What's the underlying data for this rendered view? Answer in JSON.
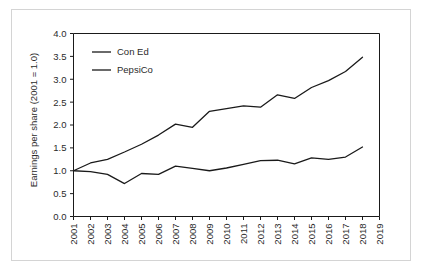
{
  "figure": {
    "background_color": "#ffffff",
    "border_color": "#d4d4d4",
    "line_color": "#1a1a1a",
    "text_color": "#2b2b2b"
  },
  "chart_data": {
    "type": "line",
    "title": "",
    "subtitle": "",
    "xlabel": "",
    "ylabel": "Earnings per share (2001 = 1.0)",
    "xlim": [
      2001,
      2019
    ],
    "ylim": [
      0.0,
      4.0
    ],
    "grid": false,
    "legend_position": "upper left",
    "x": [
      2001,
      2002,
      2003,
      2004,
      2005,
      2006,
      2007,
      2008,
      2009,
      2010,
      2011,
      2012,
      2013,
      2014,
      2015,
      2016,
      2017,
      2018
    ],
    "xtick_labels": [
      "2001",
      "2002",
      "2003",
      "2004",
      "2005",
      "2006",
      "2007",
      "2008",
      "2009",
      "2010",
      "2011",
      "2012",
      "2013",
      "2014",
      "2015",
      "2016",
      "2017",
      "2018",
      "2019"
    ],
    "xticks": [
      2001,
      2002,
      2003,
      2004,
      2005,
      2006,
      2007,
      2008,
      2009,
      2010,
      2011,
      2012,
      2013,
      2014,
      2015,
      2016,
      2017,
      2018,
      2019
    ],
    "ytick_labels": [
      "0.0",
      "0.5",
      "1.0",
      "1.5",
      "2.0",
      "2.5",
      "3.0",
      "3.5",
      "4.0"
    ],
    "yticks": [
      0.0,
      0.5,
      1.0,
      1.5,
      2.0,
      2.5,
      3.0,
      3.5,
      4.0
    ],
    "series": [
      {
        "name": "Con Ed",
        "color": "#1a1a1a",
        "values": [
          1.0,
          1.17,
          1.25,
          1.41,
          1.58,
          1.78,
          2.02,
          1.95,
          2.3,
          2.36,
          2.42,
          2.39,
          2.66,
          2.58,
          2.82,
          2.97,
          3.17,
          3.48
        ]
      },
      {
        "name": "PepsiCo",
        "color": "#1a1a1a",
        "values": [
          1.0,
          0.98,
          0.92,
          0.72,
          0.94,
          0.92,
          1.1,
          1.05,
          1.0,
          1.06,
          1.14,
          1.22,
          1.23,
          1.15,
          1.28,
          1.25,
          1.3,
          1.52
        ]
      }
    ]
  },
  "legend": {
    "entries": [
      {
        "label": "Con Ed"
      },
      {
        "label": "PepsiCo"
      }
    ]
  }
}
